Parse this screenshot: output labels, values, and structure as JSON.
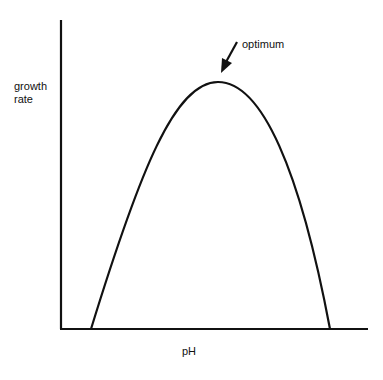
{
  "diagram": {
    "ylabel_line1": "growth",
    "ylabel_line2": "rate",
    "xlabel": "pH",
    "annotation": "optimum",
    "curve_type": "inverted parabola (bell-shaped)",
    "colors": {
      "line": "#111111",
      "background": "#ffffff"
    }
  }
}
